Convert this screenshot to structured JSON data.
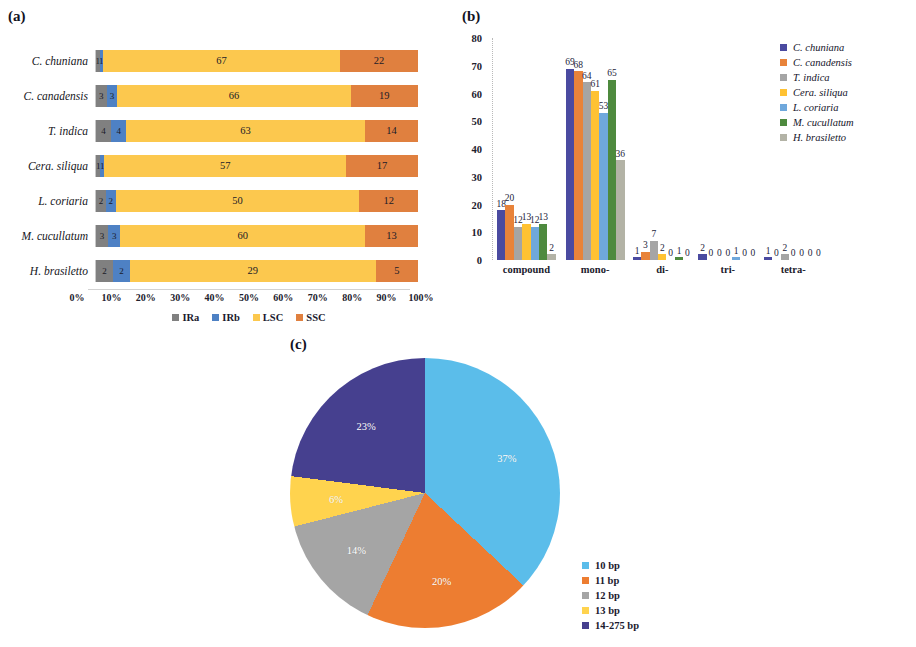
{
  "figure": {
    "panel_a_label": "(a)",
    "panel_b_label": "(b)",
    "panel_c_label": "(c)"
  },
  "colors": {
    "IRa": "#808080",
    "IRb": "#4E81C4",
    "LSC": "#FCC84E",
    "SSC": "#E0803F",
    "species": [
      "#4A4AA0",
      "#E8833A",
      "#A5A5A5",
      "#FFC233",
      "#6FA8DC",
      "#4E8A3E",
      "#B3B3A6"
    ],
    "pie": [
      "#5BBDEA",
      "#ED7D31",
      "#A5A5A5",
      "#FFD34E",
      "#46408F"
    ]
  },
  "chart_data": [
    {
      "type": "bar",
      "orientation": "horizontal",
      "stacked": true,
      "normalized": true,
      "title": "(a)",
      "xlabel": "",
      "ylabel": "",
      "xlim": [
        0,
        100
      ],
      "grid": false,
      "categories": [
        "C. chuniana",
        "C. canadensis",
        "T. indica",
        "Cera. siliqua",
        "L. coriaria",
        "M. cucullatum",
        "H. brasiletto"
      ],
      "series": [
        {
          "name": "IRa",
          "values": [
            1,
            3,
            4,
            1,
            2,
            3,
            2
          ]
        },
        {
          "name": "IRb",
          "values": [
            1,
            3,
            4,
            1,
            2,
            3,
            2
          ]
        },
        {
          "name": "LSC",
          "values": [
            67,
            66,
            63,
            57,
            50,
            60,
            29
          ]
        },
        {
          "name": "SSC",
          "values": [
            22,
            19,
            14,
            17,
            12,
            13,
            5
          ]
        }
      ],
      "legend": [
        "IRa",
        "IRb",
        "LSC",
        "SSC"
      ],
      "legend_position": "bottom",
      "xticks": [
        "0%",
        "10%",
        "20%",
        "30%",
        "40%",
        "50%",
        "60%",
        "70%",
        "80%",
        "90%",
        "100%"
      ]
    },
    {
      "type": "bar",
      "orientation": "vertical",
      "grouped": true,
      "title": "(b)",
      "xlabel": "",
      "ylabel": "",
      "ylim": [
        0,
        80
      ],
      "yticks": [
        0,
        10,
        20,
        30,
        40,
        50,
        60,
        70,
        80
      ],
      "grid": false,
      "categories": [
        "compound",
        "mono-",
        "di-",
        "tri-",
        "tetra-"
      ],
      "series": [
        {
          "name": "C. chuniana",
          "values": [
            18,
            69,
            1,
            2,
            1
          ]
        },
        {
          "name": "C. canadensis",
          "values": [
            20,
            68,
            3,
            0,
            0
          ]
        },
        {
          "name": "T. indica",
          "values": [
            12,
            64,
            7,
            0,
            2
          ]
        },
        {
          "name": "Cera. siliqua",
          "values": [
            13,
            61,
            2,
            0,
            0
          ]
        },
        {
          "name": "L. coriaria",
          "values": [
            12,
            53,
            0,
            1,
            0
          ]
        },
        {
          "name": "M. cucullatum",
          "values": [
            13,
            65,
            1,
            0,
            0
          ]
        },
        {
          "name": "H. brasiletto",
          "values": [
            2,
            36,
            0,
            0,
            0
          ]
        }
      ],
      "legend": [
        "C. chuniana",
        "C. canadensis",
        "T. indica",
        "Cera. siliqua",
        "L. coriaria",
        "M. cucullatum",
        "H. brasiletto"
      ],
      "legend_position": "right"
    },
    {
      "type": "pie",
      "title": "(c)",
      "labels": [
        "10 bp",
        "11 bp",
        "12 bp",
        "13 bp",
        "14-275 bp"
      ],
      "values": [
        37,
        20,
        14,
        6,
        23
      ],
      "value_labels": [
        "37%",
        "20%",
        "14%",
        "6%",
        "23%"
      ],
      "legend_position": "right"
    }
  ]
}
